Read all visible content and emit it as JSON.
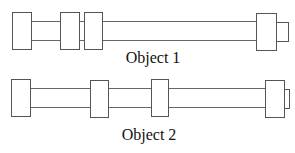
{
  "objects": [
    {
      "label": "Object 1",
      "label_pos": {
        "x": 153,
        "y": 63
      },
      "shaft": {
        "y1": 21,
        "y2": 40
      },
      "shaft_segments": [
        [
          31,
          60
        ],
        [
          79,
          84
        ],
        [
          102,
          256
        ]
      ],
      "blocks": [
        {
          "x": 12,
          "y": 12,
          "w": 19,
          "h": 37
        },
        {
          "x": 60,
          "y": 12,
          "w": 19,
          "h": 37
        },
        {
          "x": 84,
          "y": 12,
          "w": 18,
          "h": 37
        },
        {
          "x": 256,
          "y": 13,
          "w": 20,
          "h": 37
        }
      ],
      "stub": {
        "x": 276,
        "y": 22,
        "w": 12,
        "h": 19
      }
    },
    {
      "label": "Object 2",
      "label_pos": {
        "x": 149,
        "y": 140
      },
      "shaft": {
        "y1": 88,
        "y2": 107
      },
      "shaft_segments": [
        [
          30,
          90
        ],
        [
          108,
          151
        ],
        [
          168,
          265
        ]
      ],
      "blocks": [
        {
          "x": 11,
          "y": 79,
          "w": 19,
          "h": 37
        },
        {
          "x": 90,
          "y": 80,
          "w": 18,
          "h": 37
        },
        {
          "x": 151,
          "y": 79,
          "w": 17,
          "h": 37
        },
        {
          "x": 265,
          "y": 80,
          "w": 19,
          "h": 37
        }
      ],
      "stub": {
        "x": 284,
        "y": 89,
        "w": 5,
        "h": 19
      }
    }
  ]
}
